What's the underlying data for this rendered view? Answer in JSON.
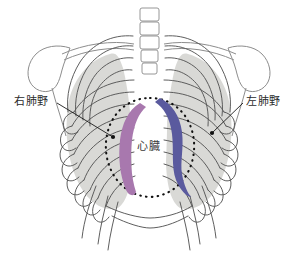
{
  "figure": {
    "background_color": "#ffffff"
  },
  "labels": {
    "right_lung_field": "右肺野",
    "left_lung_field": "左肺野",
    "heart": "心臓"
  },
  "colors": {
    "right_heart_border": "#a878ae",
    "left_heart_border": "#5a5a9e",
    "lung_shading": "#d6d6d3",
    "bone_outline": "#6f6f6f",
    "rib_stroke": "#555555",
    "dotted_outline": "#111111",
    "label_text": "#2b2b2b",
    "leader_line": "#1a1a1a"
  },
  "structures": {
    "spine": "vertebral-column",
    "scapula_left": "left-scapula",
    "scapula_right": "right-scapula",
    "clavicle": "clavicle",
    "ribs": "rib-cage",
    "cardiac_silhouette": "heart-outline-dotted",
    "right_cardiac_border": "right-heart-border-band",
    "left_cardiac_border": "left-heart-border-band"
  }
}
